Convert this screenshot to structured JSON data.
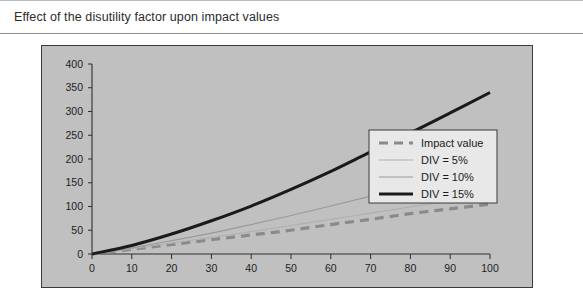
{
  "caption": {
    "text": "Effect of the disutility factor upon impact values"
  },
  "chart_data": {
    "type": "line",
    "title": "Effect of the disutility factor upon impact values",
    "xlabel": "",
    "ylabel": "",
    "xlim": [
      0,
      100
    ],
    "ylim": [
      0,
      400
    ],
    "xticks": [
      0,
      10,
      20,
      30,
      40,
      50,
      60,
      70,
      80,
      90,
      100
    ],
    "yticks": [
      0,
      50,
      100,
      150,
      200,
      250,
      300,
      350,
      400
    ],
    "grid": false,
    "legend_position": "right",
    "x": [
      0,
      10,
      20,
      30,
      40,
      50,
      60,
      70,
      80,
      90,
      100
    ],
    "series": [
      {
        "name": "Impact value",
        "values": [
          0,
          10,
          20,
          30,
          40,
          50,
          62,
          73,
          85,
          95,
          105
        ],
        "color": "#8a8a8a",
        "width": 3.2,
        "dash": "9,6"
      },
      {
        "name": "DIV = 5%",
        "values": [
          0,
          11,
          23,
          35,
          47,
          60,
          73,
          86,
          99,
          112,
          125
        ],
        "color": "#b0b0b0",
        "width": 1.2,
        "dash": "none"
      },
      {
        "name": "DIV = 10%",
        "values": [
          0,
          13,
          28,
          44,
          62,
          81,
          101,
          122,
          144,
          167,
          190
        ],
        "color": "#9a9a9a",
        "width": 1.2,
        "dash": "none"
      },
      {
        "name": "DIV = 15%",
        "values": [
          0,
          18,
          42,
          70,
          101,
          136,
          174,
          215,
          255,
          297,
          340
        ],
        "color": "#1a1a1a",
        "width": 3.0,
        "dash": "none"
      }
    ]
  },
  "legend": {
    "items": [
      {
        "label": "Impact value"
      },
      {
        "label": "DIV = 5%"
      },
      {
        "label": "DIV = 10%"
      },
      {
        "label": "DIV = 15%"
      }
    ]
  }
}
